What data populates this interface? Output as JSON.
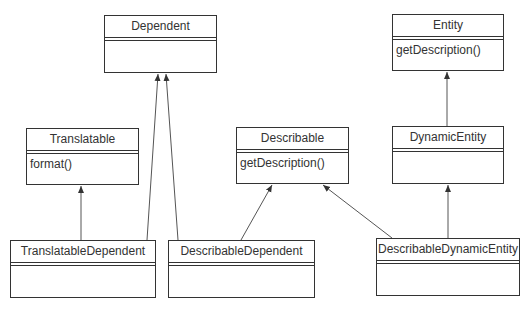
{
  "diagram": {
    "type": "UML class diagram",
    "classes": [
      {
        "id": "dependent",
        "name": "Dependent",
        "attributes": [],
        "operations": []
      },
      {
        "id": "entity",
        "name": "Entity",
        "attributes": [],
        "operations": [
          "getDescription()"
        ]
      },
      {
        "id": "translatable",
        "name": "Translatable",
        "attributes": [],
        "operations": [
          "format()"
        ]
      },
      {
        "id": "describable",
        "name": "Describable",
        "attributes": [],
        "operations": [
          "getDescription()"
        ]
      },
      {
        "id": "dynamic_entity",
        "name": "DynamicEntity",
        "attributes": [],
        "operations": []
      },
      {
        "id": "translatable_dependent",
        "name": "TranslatableDependent",
        "attributes": [],
        "operations": []
      },
      {
        "id": "describable_dependent",
        "name": "DescribableDependent",
        "attributes": [],
        "operations": []
      },
      {
        "id": "describable_dynamic_entity",
        "name": "DescribableDynamicEntity",
        "attributes": [],
        "operations": []
      }
    ],
    "relations": [
      {
        "from": "TranslatableDependent",
        "to": "Translatable",
        "type": "generalization"
      },
      {
        "from": "TranslatableDependent",
        "to": "Dependent",
        "type": "generalization"
      },
      {
        "from": "DescribableDependent",
        "to": "Dependent",
        "type": "generalization"
      },
      {
        "from": "DescribableDependent",
        "to": "Describable",
        "type": "generalization"
      },
      {
        "from": "DescribableDynamicEntity",
        "to": "Describable",
        "type": "generalization"
      },
      {
        "from": "DescribableDynamicEntity",
        "to": "DynamicEntity",
        "type": "generalization"
      },
      {
        "from": "DynamicEntity",
        "to": "Entity",
        "type": "generalization"
      }
    ]
  },
  "labels": {
    "dependent": "Dependent",
    "entity": "Entity",
    "entity_op": "getDescription()",
    "translatable": "Translatable",
    "translatable_op": "format()",
    "describable": "Describable",
    "describable_op": "getDescription()",
    "dynamic_entity": "DynamicEntity",
    "translatable_dependent": "TranslatableDependent",
    "describable_dependent": "DescribableDependent",
    "describable_dynamic_entity": "DescribableDynamicEntity"
  },
  "colors": {
    "line": "#333333",
    "fill": "#ffffff"
  }
}
